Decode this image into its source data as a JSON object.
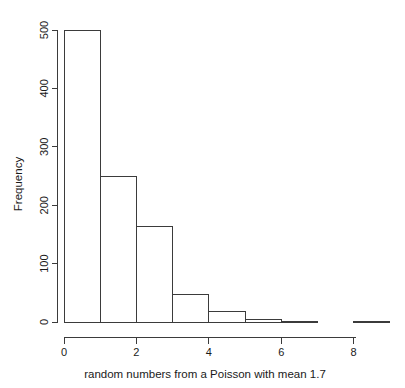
{
  "chart_data": {
    "type": "bar",
    "title": "",
    "subtitle": "",
    "xlabel": "random numbers from a Poisson with mean 1.7",
    "ylabel": "Frequency",
    "bin_edges": [
      0,
      1,
      2,
      3,
      4,
      5,
      6,
      7,
      8,
      9
    ],
    "categories": [
      "0-1",
      "1-2",
      "2-3",
      "3-4",
      "4-5",
      "5-6",
      "6-7",
      "7-8",
      "8-9"
    ],
    "values": [
      500,
      250,
      163,
      48,
      18,
      5,
      1,
      0,
      1
    ],
    "xlim": [
      0,
      9
    ],
    "ylim": [
      0,
      500
    ],
    "xticks": [
      0,
      2,
      4,
      6,
      8
    ],
    "xtick_labels": [
      "0",
      "2",
      "4",
      "6",
      "8"
    ],
    "yticks": [
      0,
      100,
      200,
      300,
      400,
      500
    ],
    "ytick_labels": [
      "0",
      "100",
      "200",
      "300",
      "400",
      "500"
    ],
    "grid": false,
    "legend": "none",
    "bar_fill": "none",
    "bar_stroke": "#3b3b3b",
    "axis_color": "#3b3b3b",
    "background": "#ffffff"
  },
  "plot": {
    "caption": "random numbers from a Poisson with mean 1.7",
    "y_axis_title": "Frequency"
  }
}
